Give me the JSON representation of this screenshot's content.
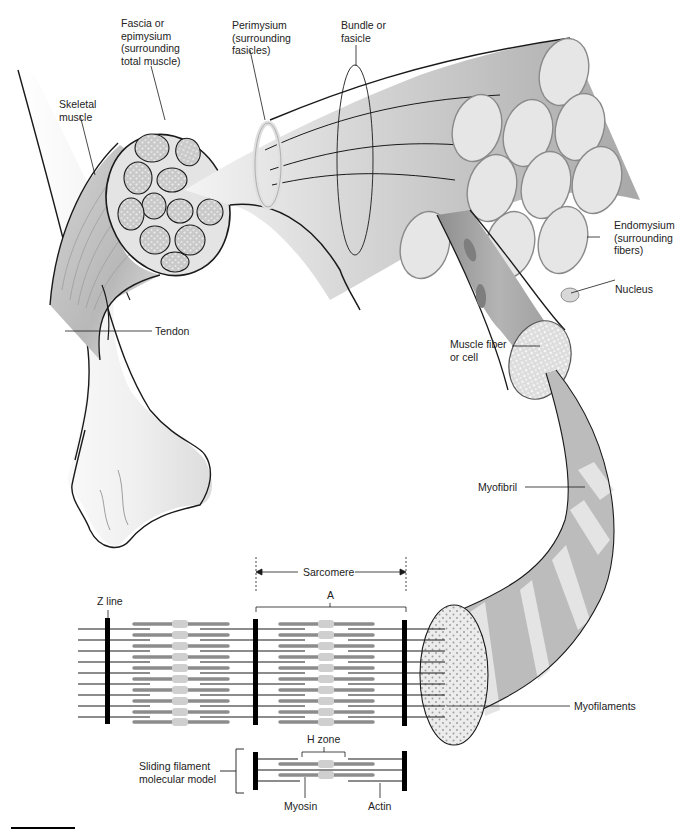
{
  "figure": {
    "colors": {
      "outline": "#1a1a1a",
      "fascicle_fill": "#bdbdbd",
      "fiber_end": "#e6e6e6",
      "myofibril_dark": "#9a9a9a",
      "myofibril_light": "#e0e0e0",
      "myosin": "#8c8c8c",
      "m_line_bulge": "#c8c8c8",
      "zline": "#000000",
      "label_text": "#222222"
    }
  },
  "labels": {
    "fascia": "Fascia or\nepimysium\n(surrounding\ntotal muscle)",
    "perimysium": "Perimysium\n(surrounding\nfasicles)",
    "bundle": "Bundle or\nfasicle",
    "skeletal_muscle": "Skeletal\nmuscle",
    "endomysium": "Endomysium\n(surrounding\nfibers)",
    "nucleus": "Nucleus",
    "muscle_fiber": "Muscle fiber\nor cell",
    "tendon": "Tendon",
    "myofibril": "Myofibril",
    "sarcomere": "Sarcomere",
    "a_band": "A",
    "z_line": "Z line",
    "myofilaments": "Myofilaments",
    "h_zone": "H zone",
    "sliding_model": "Sliding filament\nmolecular model",
    "myosin": "Myosin",
    "actin": "Actin"
  }
}
